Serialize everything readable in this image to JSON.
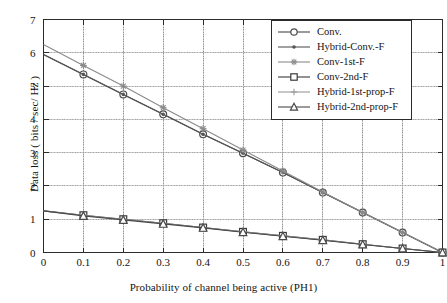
{
  "chart_data": {
    "type": "line",
    "title": "",
    "xlabel": "Probability of channel being active (PH1)",
    "ylabel": "Data loss ( bits / sec/ Hz )",
    "xlim": [
      0,
      1
    ],
    "ylim": [
      0,
      7
    ],
    "xticks": [
      "0",
      "0.1",
      "0.2",
      "0.3",
      "0.4",
      "0.5",
      "0.6",
      "0.7",
      "0.8",
      "0.9",
      "1"
    ],
    "yticks": [
      "0",
      "1",
      "2",
      "3",
      "4",
      "5",
      "6",
      "7"
    ],
    "grid": true,
    "legend_position": "top-right",
    "x": [
      0,
      0.1,
      0.2,
      0.3,
      0.4,
      0.5,
      0.6,
      0.7,
      0.8,
      0.9,
      1
    ],
    "series": [
      {
        "name": "Conv.",
        "marker": "circle",
        "color": "#4a4a4a",
        "values": [
          5.95,
          5.35,
          4.75,
          4.15,
          3.55,
          2.98,
          2.4,
          1.8,
          1.2,
          0.6,
          0.0
        ]
      },
      {
        "name": "Hybrid-Conv.-F",
        "marker": "dot",
        "color": "#555555",
        "values": [
          5.95,
          5.35,
          4.75,
          4.15,
          3.55,
          2.98,
          2.4,
          1.8,
          1.2,
          0.6,
          0.0
        ]
      },
      {
        "name": "Conv-1st-F",
        "marker": "star",
        "color": "#8a8a8a",
        "values": [
          6.25,
          5.62,
          5.0,
          4.35,
          3.72,
          3.08,
          2.45,
          1.82,
          1.2,
          0.6,
          0.0
        ]
      },
      {
        "name": "Conv-2nd-F",
        "marker": "square",
        "color": "#3a3a3a",
        "values": [
          1.25,
          1.12,
          1.0,
          0.88,
          0.75,
          0.62,
          0.5,
          0.38,
          0.25,
          0.12,
          0.0
        ]
      },
      {
        "name": "Hybrid-1st-prop-F",
        "marker": "plus",
        "color": "#9a9a9a",
        "values": [
          1.25,
          1.12,
          1.0,
          0.88,
          0.75,
          0.62,
          0.5,
          0.38,
          0.25,
          0.12,
          0.0
        ]
      },
      {
        "name": "Hybrid-2nd-prop-F",
        "marker": "triangle",
        "color": "#4a4a4a",
        "values": [
          1.25,
          1.1,
          0.98,
          0.86,
          0.74,
          0.61,
          0.49,
          0.37,
          0.24,
          0.12,
          0.0
        ]
      }
    ]
  },
  "legend": {
    "items": [
      {
        "label": "Conv.",
        "marker": "circle"
      },
      {
        "label": "Hybrid-Conv.-F",
        "marker": "dot"
      },
      {
        "label": "Conv-1st-F",
        "marker": "star"
      },
      {
        "label": "Conv-2nd-F",
        "marker": "square"
      },
      {
        "label": "Hybrid-1st-prop-F",
        "marker": "plus"
      },
      {
        "label": "Hybrid-2nd-prop-F",
        "marker": "triangle"
      }
    ]
  },
  "style": {
    "axis_color": "#2b2b2b",
    "grid_color": "#b0b0b0",
    "background": "#ffffff"
  }
}
